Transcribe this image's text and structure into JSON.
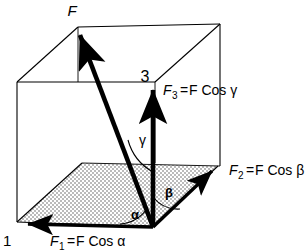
{
  "figure": {
    "type": "vector-diagram",
    "colors": {
      "background": "#ffffff",
      "line": "#000000",
      "vector": "#000000",
      "stipple_fill": "#d9d9d9"
    },
    "labels": {
      "resultant": "F",
      "corner_one": "1",
      "corner_three": "3",
      "component_x_sub": "1",
      "component_y_sub": "2",
      "component_z_sub": "3",
      "component_x_text": "F",
      "component_x_eq": "=",
      "component_x_rhs": "F Cos α",
      "component_y_rhs": "F Cos β",
      "component_z_rhs": "F Cos γ",
      "angle_alpha": "α",
      "angle_beta": "β",
      "angle_gamma": "γ"
    },
    "equations": [
      {
        "name": "F1",
        "text": "F₁ = F Cos α"
      },
      {
        "name": "F2",
        "text": "F₂ = F Cos β"
      },
      {
        "name": "F3",
        "text": "F₃ = F Cos γ"
      }
    ],
    "angles": [
      "α",
      "β",
      "γ"
    ],
    "vectors": [
      {
        "name": "resultant-F",
        "label": "F",
        "from": [
          153,
          227
        ],
        "to": [
          78,
          30
        ]
      },
      {
        "name": "component-F3",
        "label": "F₃",
        "from": [
          153,
          227
        ],
        "to": [
          153,
          84
        ]
      },
      {
        "name": "component-F1",
        "label": "F₁",
        "from": [
          153,
          227
        ],
        "to": [
          22,
          224
        ]
      },
      {
        "name": "component-F2",
        "label": "F₂",
        "from": [
          153,
          227
        ],
        "to": [
          216,
          167
        ]
      }
    ]
  }
}
